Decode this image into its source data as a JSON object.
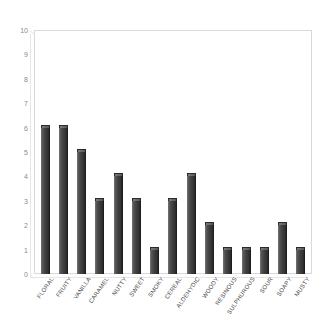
{
  "chart_data": {
    "type": "bar",
    "title": "",
    "subtitle": "",
    "xlabel": "",
    "ylabel": "",
    "ylim": [
      0,
      10
    ],
    "grid": false,
    "legend": null,
    "legend_position": "none",
    "orientation": "vertical",
    "bar_color": "#3f3f3f",
    "categories": [
      "FLORAL",
      "FRUITY",
      "VANILLA",
      "CARAMEL",
      "NUTTY",
      "SWEET",
      "SMOKY",
      "CEREAL",
      "ALDEHYDIC",
      "WOODY",
      "RESINOUS",
      "SULPHUROUS",
      "SOUR",
      "SOAPY",
      "MUSTY"
    ],
    "values": [
      6,
      6,
      5,
      3,
      4,
      3,
      1,
      3,
      4,
      2,
      1,
      1,
      1,
      2,
      1
    ],
    "yticks": [
      0,
      1,
      2,
      3,
      4,
      5,
      6,
      7,
      8,
      9,
      10
    ],
    "ytick_labels": [
      "0",
      "1",
      "2",
      "3",
      "4",
      "5",
      "6",
      "7",
      "8",
      "9",
      "10"
    ]
  },
  "style": {
    "frame_color": "#d9d9d9",
    "axis_text_color": "#8a8a8a",
    "category_text_color": "#4a4a4a",
    "background": "#ffffff"
  }
}
